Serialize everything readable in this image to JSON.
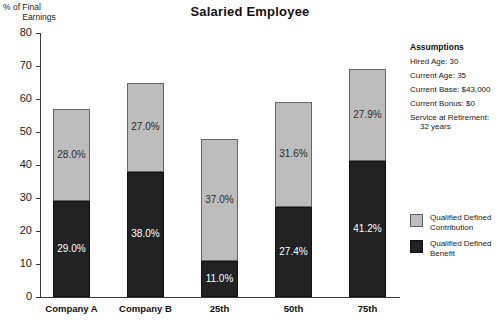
{
  "chart_data": {
    "type": "bar",
    "subtype": "stacked-bar",
    "title": "Salaried Employee",
    "xlabel": "",
    "ylabel": "% of Final Earnings",
    "ylabel_line1": "% of Final",
    "ylabel_line2": "Earnings",
    "ylim": [
      0,
      80
    ],
    "ytick_step": 10,
    "yticks": [
      0,
      10,
      20,
      30,
      40,
      50,
      60,
      70,
      80
    ],
    "ytick_labels": [
      "0",
      "10",
      "20",
      "30",
      "40",
      "50",
      "60",
      "70",
      "80"
    ],
    "grid": false,
    "legend_position": "right",
    "categories": [
      "Company A",
      "Company B",
      "25th",
      "50th",
      "75th"
    ],
    "series": [
      {
        "name": "Qualified Defined Benefit",
        "color": "#222222",
        "values": [
          29.0,
          38.0,
          11.0,
          27.4,
          41.2
        ],
        "labels": [
          "29.0%",
          "38.0%",
          "11.0%",
          "27.4%",
          "41.2%"
        ]
      },
      {
        "name": "Qualified Defined Contribution",
        "color": "#bdbdbd",
        "values": [
          28.0,
          27.0,
          37.0,
          31.6,
          27.9
        ],
        "labels": [
          "28.0%",
          "27.0%",
          "37.0%",
          "31.6%",
          "27.9%"
        ]
      }
    ],
    "totals": [
      57.0,
      65.0,
      48.0,
      59.0,
      69.1
    ],
    "legend": [
      {
        "label_line1": "Qualified Defined",
        "label_line2": "Contribution",
        "color": "#bdbdbd"
      },
      {
        "label_line1": "Qualified Defined",
        "label_line2": "Benefit",
        "color": "#222222"
      }
    ],
    "annotations": {
      "assumptions_heading": "Assumptions",
      "assumptions": [
        {
          "text": "Hired Age: 30",
          "cont": ""
        },
        {
          "text": "Current Age: 35",
          "cont": ""
        },
        {
          "text": "Current Base: $43,000",
          "cont": ""
        },
        {
          "text": "Current Bonus: $0",
          "cont": ""
        },
        {
          "text": "Service at Retirement:",
          "cont": "32 years"
        }
      ]
    }
  }
}
